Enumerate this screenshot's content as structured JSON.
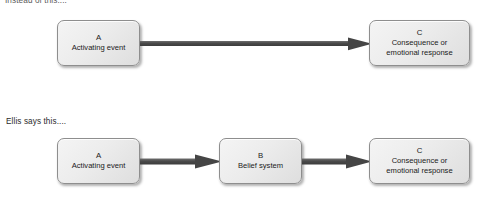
{
  "diagram": {
    "title_top": "Instead of this....",
    "title_bottom": "Ellis says this....",
    "accent_color": "#4a4a4a",
    "box_fill": "#ececec",
    "box_border": "#8e8e8e",
    "rows": [
      {
        "id": "row-top",
        "caption": "Instead of this....",
        "nodes": [
          {
            "letter": "A",
            "label_line_1": "Activating event",
            "label_line_2": ""
          },
          {
            "letter": "C",
            "label_line_1": "Consequence or",
            "label_line_2": "emotional response"
          }
        ],
        "arrows": [
          {
            "from": "A",
            "to": "C",
            "direction": "right"
          }
        ]
      },
      {
        "id": "row-bottom",
        "caption": "Ellis says this....",
        "nodes": [
          {
            "letter": "A",
            "label_line_1": "Activating event",
            "label_line_2": ""
          },
          {
            "letter": "B",
            "label_line_1": "Belief system",
            "label_line_2": ""
          },
          {
            "letter": "C",
            "label_line_1": "Consequence or",
            "label_line_2": "emotional response"
          }
        ],
        "arrows": [
          {
            "from": "A",
            "to": "B",
            "direction": "right"
          },
          {
            "from": "B",
            "to": "C",
            "direction": "right"
          }
        ]
      }
    ]
  }
}
